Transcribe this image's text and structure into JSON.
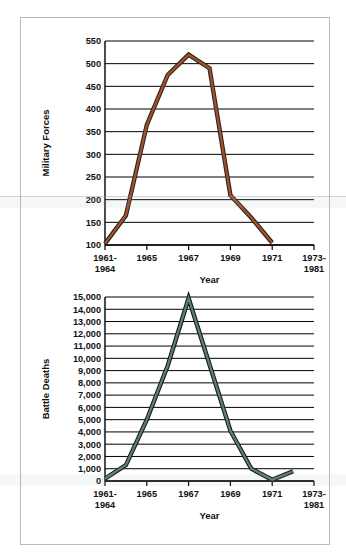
{
  "figure": {
    "background": "#ffffff",
    "frame_border_color": "#b9b9b9"
  },
  "chart_data": [
    {
      "type": "line",
      "id": "military-forces",
      "title": "",
      "xlabel": "Year",
      "ylabel": "Military Forces",
      "ylim": [
        100,
        550
      ],
      "ytick_step": 50,
      "yticks": [
        "100",
        "150",
        "200",
        "250",
        "300",
        "350",
        "400",
        "450",
        "500",
        "550"
      ],
      "ytick_values": [
        100,
        150,
        200,
        250,
        300,
        350,
        400,
        450,
        500,
        550
      ],
      "xticks": [
        "1961-\n1964",
        "1965",
        "1967",
        "1969",
        "1971",
        "1973-\n1981"
      ],
      "xtick_labels": [
        {
          "line1": "1961-",
          "line2": "1964"
        },
        {
          "line1": "1965",
          "line2": ""
        },
        {
          "line1": "1967",
          "line2": ""
        },
        {
          "line1": "1969",
          "line2": ""
        },
        {
          "line1": "1971",
          "line2": ""
        },
        {
          "line1": "1973-",
          "line2": "1981"
        }
      ],
      "x": [
        1964,
        1965,
        1966,
        1967,
        1968,
        1969,
        1970,
        1971,
        1972
      ],
      "values": [
        103,
        165,
        365,
        475,
        520,
        490,
        210,
        160,
        105
      ],
      "line_color": "#A0522D",
      "line_outline_color": "#2b2118",
      "grid": true,
      "grid_axis": "y",
      "legend": "none"
    },
    {
      "type": "line",
      "id": "battle-deaths",
      "title": "",
      "xlabel": "Year",
      "ylabel": "Battle Deaths",
      "ylim": [
        0,
        15000
      ],
      "ytick_step": 1000,
      "yticks": [
        "0",
        "1,000",
        "2,000",
        "3,000",
        "4,000",
        "5,000",
        "6,000",
        "7,000",
        "8,000",
        "9,000",
        "10,000",
        "11,000",
        "12,000",
        "13,000",
        "14,000",
        "15,000"
      ],
      "ytick_values": [
        0,
        1000,
        2000,
        3000,
        4000,
        5000,
        6000,
        7000,
        8000,
        9000,
        10000,
        11000,
        12000,
        13000,
        14000,
        15000
      ],
      "xticks": [
        "1961-\n1964",
        "1965",
        "1967",
        "1969",
        "1971",
        "1973-\n1981"
      ],
      "xtick_labels": [
        {
          "line1": "1961-",
          "line2": "1964"
        },
        {
          "line1": "1965",
          "line2": ""
        },
        {
          "line1": "1967",
          "line2": ""
        },
        {
          "line1": "1969",
          "line2": ""
        },
        {
          "line1": "1971",
          "line2": ""
        },
        {
          "line1": "1973-",
          "line2": "1981"
        }
      ],
      "x": [
        1964,
        1965,
        1966,
        1967,
        1968,
        1969,
        1970,
        1971,
        1972,
        1973
      ],
      "values": [
        200,
        1300,
        5000,
        9400,
        14900,
        9500,
        4100,
        1000,
        100,
        800
      ],
      "line_color": "#5f7d7a",
      "line_outline_color": "#131a19",
      "grid": true,
      "grid_axis": "y",
      "legend": "none"
    }
  ]
}
